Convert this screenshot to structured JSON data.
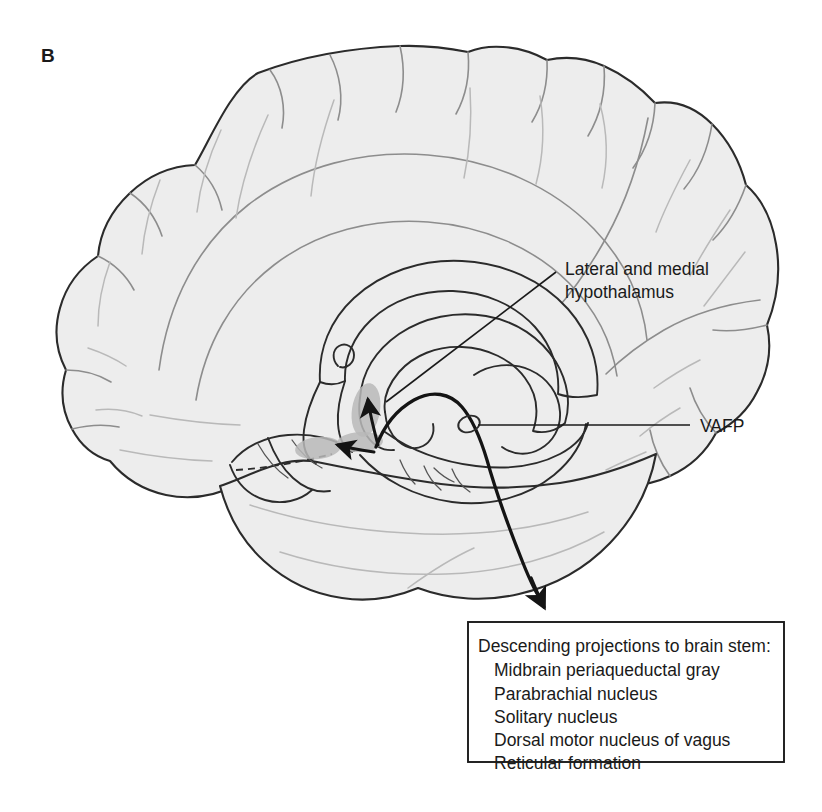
{
  "figure": {
    "panel_label": "B",
    "background_color": "#ffffff",
    "cortex_fill_color": "#ededed",
    "outline_color": "#2b2b2b",
    "nucleus_shade_color": "#b8b8b8",
    "pathway_color": "#141414"
  },
  "callouts": [
    {
      "name": "hypothalamus-callout",
      "lines": [
        "Lateral and medial",
        "hypothalamus"
      ],
      "line1": "Lateral and medial",
      "line2": "hypothalamus",
      "text_x": 565,
      "text_y": 268,
      "leader_from_x": 556,
      "leader_from_y": 272,
      "leader_to_x": 386,
      "leader_to_y": 402
    },
    {
      "name": "vafp-callout",
      "line1": "VAFP",
      "text_x": 700,
      "text_y": 432,
      "leader_from_x": 690,
      "leader_from_y": 425,
      "leader_to_x": 478,
      "leader_to_y": 425
    }
  ],
  "callout_box": {
    "name": "descending-projections-box",
    "x": 468,
    "y": 622,
    "width": 316,
    "height": 140,
    "heading": "Descending projections to brain stem:",
    "items": [
      "Midbrain periaqueductal gray",
      "Parabrachial nucleus",
      "Solitary nucleus",
      "Dorsal motor nucleus of vagus",
      "Reticular formation"
    ]
  },
  "labels_summary": {
    "hypothalamus": "Lateral and medial hypothalamus",
    "vafp": "VAFP",
    "box_heading": "Descending projections to brain stem:"
  }
}
